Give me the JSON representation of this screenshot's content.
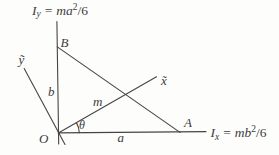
{
  "colors": {
    "ink": "#454545",
    "paper": "#fdfdfc"
  },
  "labels": {
    "iy": {
      "i": "I",
      "sub": "y",
      "eq": "=",
      "expr": "ma",
      "sup": "2",
      "tail": "/6"
    },
    "ix": {
      "i": "I",
      "sub": "x",
      "eq": "=",
      "expr": "mb",
      "sup": "2",
      "tail": "/6"
    },
    "point_b": "B",
    "point_a": "A",
    "origin": "O",
    "axis_ytilde": "ỹ",
    "axis_xtilde": "x̃",
    "dim_b": "b",
    "dim_a": "a",
    "mass": "m",
    "angle_theta": "θ"
  }
}
